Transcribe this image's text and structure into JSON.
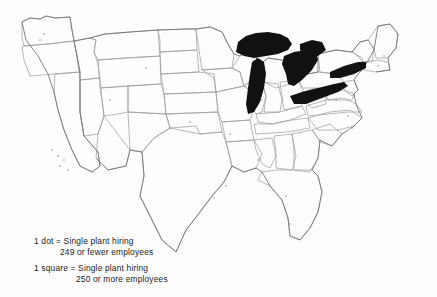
{
  "map": {
    "title": "United States dot map of single plant hiring",
    "region_name": "contiguous-united-states",
    "colors": {
      "background": "#fdfdfc",
      "state_border": "#9a9a9a",
      "coastline": "#6f6f6f",
      "lake_fill": "#111111",
      "dot_marker": "#7a7a7a",
      "text": "#1a1a1a"
    },
    "filled_features": [
      "Lake Superior",
      "Lake Michigan",
      "Lake Huron",
      "Lake Erie",
      "Lake Ontario",
      "Georgian Bay"
    ]
  },
  "legend": {
    "items": [
      {
        "symbol": "dot",
        "line1": "1 dot = Single plant hiring",
        "line2": "249 or fewer employees"
      },
      {
        "symbol": "square",
        "line1": "1 square = Single plant hiring",
        "line2": "250 or more employees"
      }
    ]
  }
}
